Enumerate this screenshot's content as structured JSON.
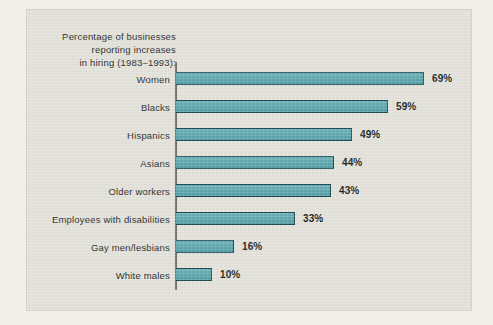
{
  "chart_data": {
    "type": "bar",
    "orientation": "horizontal",
    "title": "Percentage of businesses\nreporting increases\nin hiring (1983–1993):",
    "title_lines": [
      "Percentage of businesses",
      "reporting increases",
      "in hiring (1983–1993):"
    ],
    "xlabel": "",
    "ylabel": "",
    "xlim": [
      0,
      69
    ],
    "grid": false,
    "legend": false,
    "categories": [
      "Women",
      "Blacks",
      "Hispanics",
      "Asians",
      "Older workers",
      "Employees with disabilities",
      "Gay men/lesbians",
      "White males"
    ],
    "values": [
      69,
      59,
      49,
      44,
      43,
      33,
      16,
      10
    ],
    "value_labels": [
      "69%",
      "59%",
      "49%",
      "44%",
      "43%",
      "33%",
      "16%",
      "10%"
    ],
    "bars": [
      {
        "label": "Women",
        "value": 69,
        "value_label": "69%"
      },
      {
        "label": "Blacks",
        "value": 59,
        "value_label": "59%"
      },
      {
        "label": "Hispanics",
        "value": 49,
        "value_label": "49%"
      },
      {
        "label": "Asians",
        "value": 44,
        "value_label": "44%"
      },
      {
        "label": "Older workers",
        "value": 43,
        "value_label": "43%"
      },
      {
        "label": "Employees with disabilities",
        "value": 33,
        "value_label": "33%"
      },
      {
        "label": "Gay men/lesbians",
        "value": 16,
        "value_label": "16%"
      },
      {
        "label": "White males",
        "value": 10,
        "value_label": "10%"
      }
    ],
    "colors": {
      "bar_fill": "#63A9AF",
      "bar_outline": "#1B4A55",
      "axis_line": "#6F6E68",
      "panel_background": "#E3E2DB",
      "page_background": "#EFEEE8",
      "text": "#2B2B2B",
      "value_text": "#1D1D1D"
    }
  }
}
